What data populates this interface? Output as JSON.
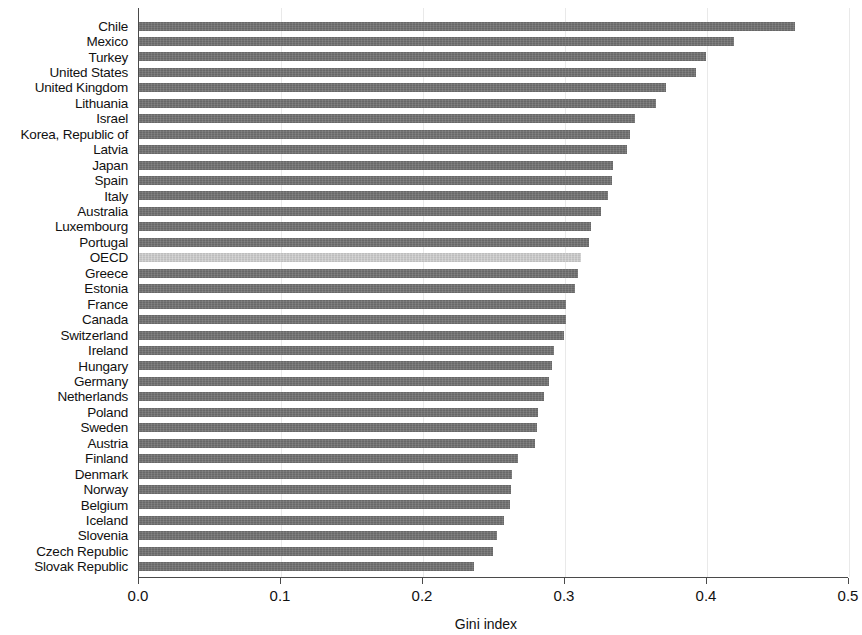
{
  "chart_data": {
    "type": "bar",
    "orientation": "horizontal",
    "title": "",
    "subtitle": "",
    "xlabel": "Gini index",
    "ylabel": "",
    "xlim": [
      0.0,
      0.5
    ],
    "xticks": [
      "0.0",
      "0.1",
      "0.2",
      "0.3",
      "0.4",
      "0.5"
    ],
    "xtick_values": [
      0.0,
      0.1,
      0.2,
      0.3,
      0.4,
      0.5
    ],
    "grid": "vertical-light",
    "legend": "none",
    "highlight_category": "OECD",
    "bar_color": "#6e6e6e",
    "highlight_color": "#c6c6c6",
    "axis_color": "#4a4a4a",
    "categories": [
      "Chile",
      "Mexico",
      "Turkey",
      "United States",
      "United Kingdom",
      "Lithuania",
      "Israel",
      "Korea, Republic of",
      "Latvia",
      "Japan",
      "Spain",
      "Italy",
      "Australia",
      "Luxembourg",
      "Portugal",
      "OECD",
      "Greece",
      "Estonia",
      "France",
      "Canada",
      "Switzerland",
      "Ireland",
      "Hungary",
      "Germany",
      "Netherlands",
      "Poland",
      "Sweden",
      "Austria",
      "Finland",
      "Denmark",
      "Norway",
      "Belgium",
      "Iceland",
      "Slovenia",
      "Czech Republic",
      "Slovak Republic"
    ],
    "values": [
      0.462,
      0.419,
      0.399,
      0.392,
      0.371,
      0.364,
      0.349,
      0.346,
      0.344,
      0.334,
      0.333,
      0.33,
      0.325,
      0.318,
      0.317,
      0.311,
      0.309,
      0.307,
      0.301,
      0.301,
      0.299,
      0.292,
      0.291,
      0.289,
      0.285,
      0.281,
      0.28,
      0.279,
      0.267,
      0.263,
      0.262,
      0.261,
      0.257,
      0.252,
      0.249,
      0.236
    ]
  }
}
